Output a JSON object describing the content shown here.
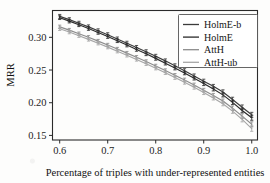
{
  "chart_data": {
    "type": "line",
    "title": "",
    "subtitle": "",
    "xlabel": "Percentage of triples with under-represented entities",
    "ylabel": "MRR",
    "xlim": [
      0.585,
      1.012
    ],
    "ylim": [
      0.143,
      0.341
    ],
    "xticks": [
      0.6,
      0.7,
      0.8,
      0.9,
      1.0
    ],
    "xticklabels": [
      "0.6",
      "0.7",
      "0.8",
      "0.9",
      "1.0"
    ],
    "yticks": [
      0.15,
      0.2,
      0.25,
      0.3
    ],
    "yticklabels": [
      "0.15",
      "0.20",
      "0.25",
      "0.30"
    ],
    "grid": false,
    "legend_position": "upper right",
    "error_bars": true,
    "x": [
      0.6,
      0.62,
      0.64,
      0.66,
      0.68,
      0.7,
      0.72,
      0.74,
      0.76,
      0.78,
      0.8,
      0.82,
      0.84,
      0.86,
      0.88,
      0.9,
      0.92,
      0.94,
      0.96,
      0.98,
      1.0
    ],
    "series": [
      {
        "name": "HolmE-b",
        "color": "#3b3b3b",
        "values": [
          0.332,
          0.327,
          0.3215,
          0.316,
          0.31,
          0.304,
          0.2975,
          0.291,
          0.2845,
          0.278,
          0.271,
          0.264,
          0.2565,
          0.249,
          0.241,
          0.233,
          0.225,
          0.2165,
          0.205,
          0.193,
          0.1815
        ],
        "errors": [
          0.003,
          0.003,
          0.003,
          0.003,
          0.003,
          0.003,
          0.003,
          0.003,
          0.003,
          0.003,
          0.003,
          0.003,
          0.003,
          0.003,
          0.003,
          0.003,
          0.003,
          0.0032,
          0.0034,
          0.0036,
          0.0038
        ]
      },
      {
        "name": "HolmE",
        "color": "#2a2a2a",
        "values": [
          0.33,
          0.3248,
          0.3192,
          0.3135,
          0.3075,
          0.3012,
          0.2948,
          0.2882,
          0.2815,
          0.2748,
          0.2678,
          0.2605,
          0.253,
          0.2455,
          0.2375,
          0.2292,
          0.221,
          0.212,
          0.2005,
          0.1882,
          0.177
        ],
        "errors": [
          0.0028,
          0.0028,
          0.0028,
          0.0028,
          0.0028,
          0.0028,
          0.0028,
          0.0028,
          0.0028,
          0.0028,
          0.0028,
          0.0028,
          0.0028,
          0.0028,
          0.0028,
          0.003,
          0.003,
          0.0032,
          0.0034,
          0.0036,
          0.0038
        ]
      },
      {
        "name": "AttH",
        "color": "#8c8c8c",
        "values": [
          0.316,
          0.311,
          0.3055,
          0.3,
          0.2942,
          0.2882,
          0.282,
          0.2758,
          0.2695,
          0.263,
          0.2562,
          0.2492,
          0.242,
          0.2348,
          0.2272,
          0.2192,
          0.2112,
          0.2025,
          0.1915,
          0.1795,
          0.167
        ],
        "errors": [
          0.0026,
          0.0026,
          0.0026,
          0.0026,
          0.0026,
          0.0026,
          0.0026,
          0.0026,
          0.0026,
          0.0026,
          0.0026,
          0.0026,
          0.0026,
          0.0028,
          0.0028,
          0.0028,
          0.003,
          0.0032,
          0.0034,
          0.0036,
          0.0038
        ]
      },
      {
        "name": "AttH-ub",
        "color": "#a6a6a6",
        "values": [
          0.313,
          0.308,
          0.3025,
          0.2968,
          0.291,
          0.285,
          0.2788,
          0.2725,
          0.2662,
          0.2596,
          0.2528,
          0.2458,
          0.2385,
          0.2312,
          0.2235,
          0.2155,
          0.2072,
          0.1985,
          0.1872,
          0.1745,
          0.1605
        ],
        "errors": [
          0.0026,
          0.0026,
          0.0026,
          0.0026,
          0.0026,
          0.0026,
          0.0026,
          0.0026,
          0.0026,
          0.0026,
          0.0026,
          0.0026,
          0.0028,
          0.0028,
          0.0028,
          0.003,
          0.003,
          0.0032,
          0.0034,
          0.0038,
          0.0042
        ]
      }
    ]
  },
  "legend": {
    "entries": [
      "HolmE-b",
      "HolmE",
      "AttH",
      "AttH-ub"
    ]
  }
}
